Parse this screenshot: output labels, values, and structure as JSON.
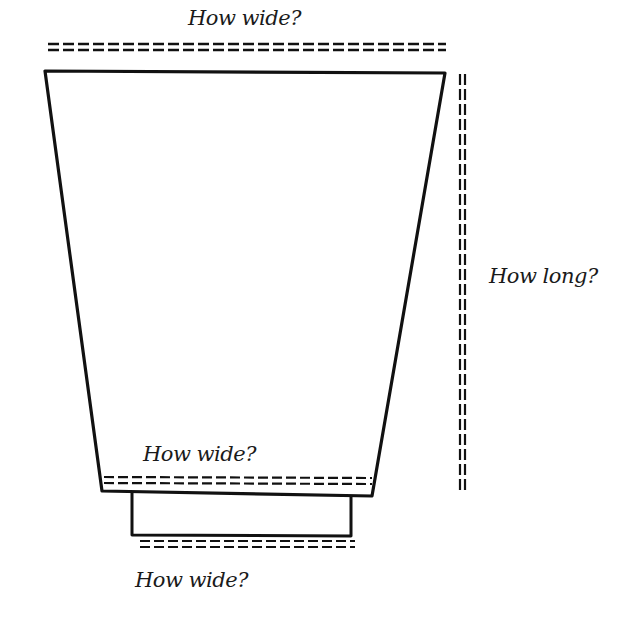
{
  "labels": {
    "top_width": "How wide?",
    "length": "How long?",
    "lower_width": "How wide?",
    "cuff_width": "How wide?"
  },
  "colors": {
    "ink": "#111111",
    "background": "#ffffff"
  }
}
